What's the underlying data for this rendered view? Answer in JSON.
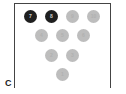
{
  "diagram": {
    "label": "C",
    "colors": {
      "standing": "#1f1f1f",
      "down": "#bdbdbd",
      "frame": "#444444"
    },
    "pins": [
      {
        "number": "7",
        "state": "standing",
        "x": 24,
        "y": 10
      },
      {
        "number": "8",
        "state": "standing",
        "x": 45,
        "y": 10
      },
      {
        "number": "9",
        "state": "down",
        "x": 66,
        "y": 10
      },
      {
        "number": "10",
        "state": "down",
        "x": 87,
        "y": 10
      },
      {
        "number": "4",
        "state": "down",
        "x": 35,
        "y": 29
      },
      {
        "number": "5",
        "state": "down",
        "x": 56,
        "y": 29
      },
      {
        "number": "6",
        "state": "down",
        "x": 77,
        "y": 29
      },
      {
        "number": "2",
        "state": "down",
        "x": 45,
        "y": 49
      },
      {
        "number": "3",
        "state": "down",
        "x": 66,
        "y": 49
      },
      {
        "number": "1",
        "state": "down",
        "x": 56,
        "y": 68
      }
    ]
  }
}
